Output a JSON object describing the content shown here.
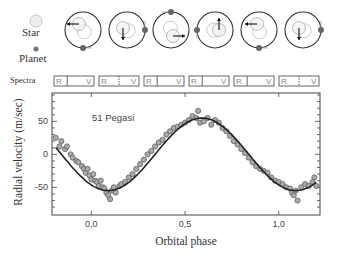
{
  "legend": {
    "star_label": "Star",
    "planet_label": "Planet",
    "spectra_label": "Spectra"
  },
  "orbits": [
    {
      "cx": 83,
      "star_dx": -4,
      "star_dy": -6,
      "planet_angle": 90,
      "arrow": "left"
    },
    {
      "cx": 127,
      "star_dx": -4,
      "star_dy": -2,
      "planet_angle": 0,
      "arrow": "down"
    },
    {
      "cx": 171,
      "star_dx": 2,
      "star_dy": 6,
      "planet_angle": 270,
      "arrow": "right"
    },
    {
      "cx": 215,
      "star_dx": 4,
      "star_dy": 0,
      "planet_angle": 180,
      "arrow": "up"
    },
    {
      "cx": 259,
      "star_dx": -2,
      "star_dy": -6,
      "planet_angle": 90,
      "arrow": "left"
    },
    {
      "cx": 303,
      "star_dx": -4,
      "star_dy": -2,
      "planet_angle": 0,
      "arrow": "down"
    }
  ],
  "spectra": [
    {
      "x": 54,
      "left": "R",
      "right": "V",
      "marker_offset": 0.33
    },
    {
      "x": 99,
      "left": "R",
      "right": "V",
      "marker_offset": 0.5
    },
    {
      "x": 144,
      "left": "R",
      "right": "V",
      "marker_offset": 0.33
    },
    {
      "x": 189,
      "left": "R",
      "right": "V",
      "marker_offset": 0.33
    },
    {
      "x": 234,
      "left": "R",
      "right": "V",
      "marker_offset": 0.33
    },
    {
      "x": 279,
      "left": "R",
      "right": "V",
      "marker_offset": 0.5
    }
  ],
  "chart_data": {
    "type": "scatter",
    "title": "",
    "annotation": "51 Pegasi",
    "xlabel": "Orbital phase",
    "ylabel": "Radial velocity (m/sec)",
    "xlim": [
      -0.21,
      1.22
    ],
    "ylim": [
      -92,
      93
    ],
    "xticks": [
      0.0,
      0.5,
      1.0
    ],
    "xtick_labels": [
      "0,0",
      "0,5",
      "1,0"
    ],
    "yticks": [
      -50,
      0,
      50
    ],
    "ytick_labels": [
      "-50",
      "0",
      "50"
    ],
    "grid": false,
    "fit": {
      "amplitude": 55,
      "phase_of_min": 0.09,
      "offset": 0
    },
    "series": [
      {
        "name": "observations",
        "x": [
          -0.19,
          -0.17,
          -0.16,
          -0.14,
          -0.13,
          -0.11,
          -0.1,
          -0.08,
          -0.07,
          -0.05,
          -0.04,
          -0.03,
          -0.02,
          -0.01,
          0.0,
          0.01,
          0.02,
          0.03,
          0.04,
          0.05,
          0.06,
          0.07,
          0.08,
          0.09,
          0.1,
          0.11,
          0.12,
          0.13,
          0.15,
          0.16,
          0.18,
          0.2,
          0.22,
          0.24,
          0.26,
          0.28,
          0.3,
          0.32,
          0.34,
          0.36,
          0.38,
          0.4,
          0.42,
          0.44,
          0.46,
          0.48,
          0.5,
          0.52,
          0.54,
          0.56,
          0.57,
          0.58,
          0.6,
          0.62,
          0.64,
          0.66,
          0.68,
          0.7,
          0.72,
          0.74,
          0.76,
          0.78,
          0.8,
          0.82,
          0.84,
          0.86,
          0.88,
          0.9,
          0.92,
          0.94,
          0.96,
          0.98,
          1.0,
          1.02,
          1.04,
          1.06,
          1.07,
          1.08,
          1.09,
          1.1,
          1.12,
          1.14,
          1.16,
          1.18,
          1.19,
          1.2
        ],
        "y": [
          25,
          12,
          20,
          8,
          12,
          0,
          -5,
          -10,
          -12,
          -18,
          -22,
          -28,
          -22,
          -32,
          -38,
          -30,
          -40,
          -42,
          -48,
          -40,
          -50,
          -52,
          -58,
          -62,
          -68,
          -55,
          -50,
          -58,
          -48,
          -45,
          -42,
          -35,
          -30,
          -22,
          -15,
          -8,
          0,
          5,
          12,
          18,
          22,
          30,
          35,
          40,
          42,
          45,
          48,
          52,
          58,
          55,
          66,
          48,
          50,
          55,
          45,
          52,
          48,
          40,
          35,
          28,
          20,
          15,
          8,
          2,
          -5,
          -12,
          -18,
          -22,
          -25,
          -28,
          -35,
          -40,
          -42,
          -45,
          -50,
          -52,
          -58,
          -62,
          -55,
          -70,
          -50,
          -45,
          -48,
          -42,
          -35,
          -48
        ]
      }
    ]
  }
}
